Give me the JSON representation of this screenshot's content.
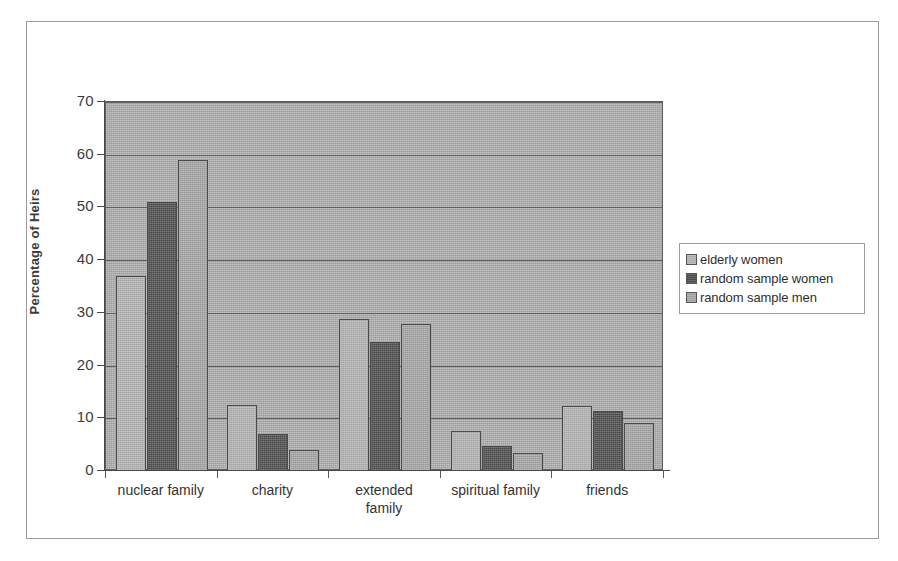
{
  "figure": {
    "frame": true,
    "background_color": "#ffffff",
    "plot_background_color": "#aaaaaa"
  },
  "axes": {
    "y_title": "Percentage of Heirs",
    "y_ticks": [
      "0",
      "10",
      "20",
      "30",
      "40",
      "50",
      "60",
      "70"
    ],
    "x_tick_marks": 6
  },
  "legend": {
    "entries": [
      {
        "label": "elderly women",
        "color": "#b3b3b3"
      },
      {
        "label": "random sample women",
        "color": "#4f4f4f"
      },
      {
        "label": "random sample men",
        "color": "#a6a6a6"
      }
    ]
  },
  "chart_data": {
    "type": "bar",
    "title": "",
    "xlabel": "",
    "ylabel": "Percentage of Heirs",
    "ylim": [
      0,
      70
    ],
    "ytick_step": 10,
    "grid": true,
    "legend_position": "right",
    "categories": [
      "nuclear family",
      "charity",
      "extended\nfamily",
      "spiritual family",
      "friends"
    ],
    "series": [
      {
        "name": "elderly women",
        "color": "#b3b3b3",
        "values": [
          37,
          12.5,
          28.8,
          7.5,
          12.3
        ]
      },
      {
        "name": "random sample women",
        "color": "#4f4f4f",
        "values": [
          51,
          7,
          24.5,
          4.7,
          11.4
        ]
      },
      {
        "name": "random sample men",
        "color": "#a6a6a6",
        "values": [
          59,
          4,
          27.8,
          3.5,
          9.2
        ]
      }
    ]
  }
}
